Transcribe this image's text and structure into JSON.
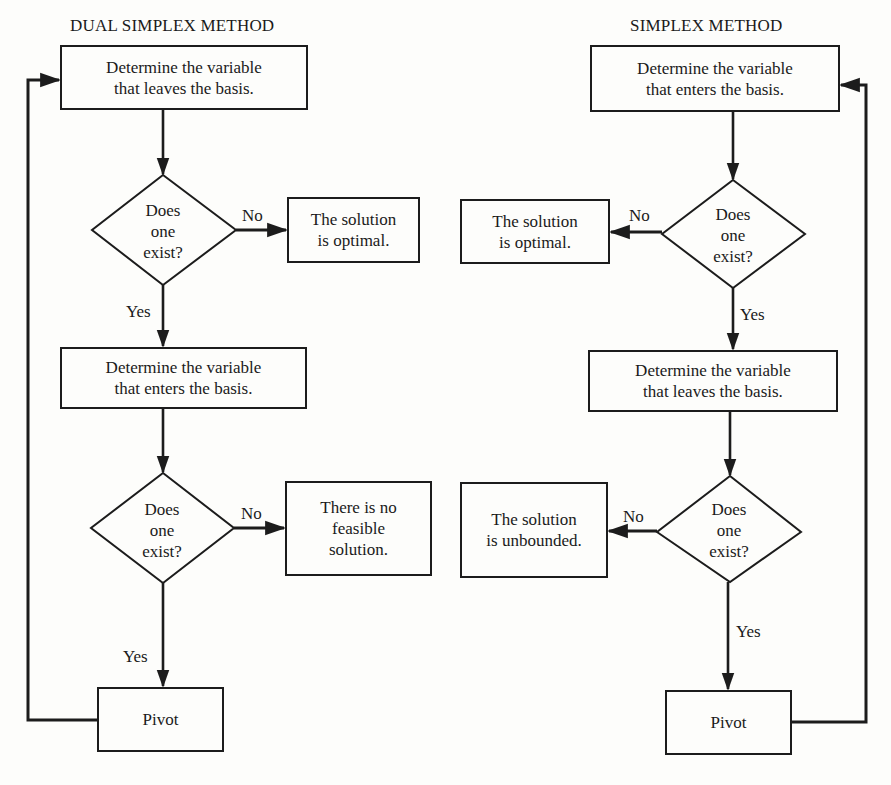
{
  "dual_simplex": {
    "title": "DUAL SIMPLEX METHOD",
    "step1": {
      "line1": "Determine the variable",
      "line2": "that leaves the basis."
    },
    "decision1": {
      "line1": "Does",
      "line2": "one",
      "line3": "exist?",
      "no_label": "No",
      "yes_label": "Yes"
    },
    "outcome1": {
      "line1": "The solution",
      "line2": "is optimal."
    },
    "step2": {
      "line1": "Determine the variable",
      "line2": "that enters the basis."
    },
    "decision2": {
      "line1": "Does",
      "line2": "one",
      "line3": "exist?",
      "no_label": "No",
      "yes_label": "Yes"
    },
    "outcome2": {
      "line1": "There is no",
      "line2": "feasible",
      "line3": "solution."
    },
    "pivot": "Pivot"
  },
  "simplex": {
    "title": "SIMPLEX METHOD",
    "step1": {
      "line1": "Determine the variable",
      "line2": "that enters the basis."
    },
    "decision1": {
      "line1": "Does",
      "line2": "one",
      "line3": "exist?",
      "no_label": "No",
      "yes_label": "Yes"
    },
    "outcome1": {
      "line1": "The solution",
      "line2": "is optimal."
    },
    "step2": {
      "line1": "Determine the variable",
      "line2": "that leaves the basis."
    },
    "decision2": {
      "line1": "Does",
      "line2": "one",
      "line3": "exist?",
      "no_label": "No",
      "yes_label": "Yes"
    },
    "outcome2": {
      "line1": "The solution",
      "line2": "is unbounded."
    },
    "pivot": "Pivot"
  },
  "colors": {
    "line": "#1c1c1c",
    "background": "#fdfdfb"
  }
}
